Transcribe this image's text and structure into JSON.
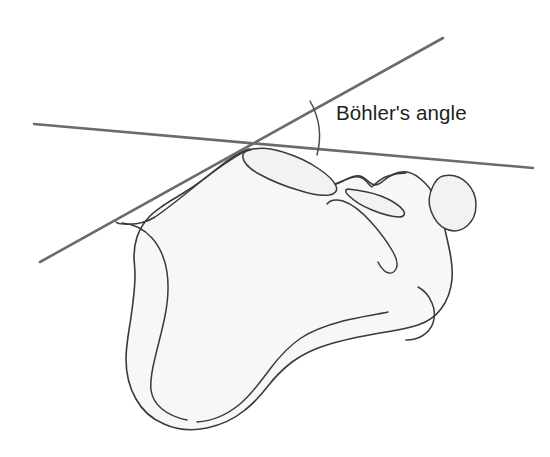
{
  "figure": {
    "title": "Böhler's angle",
    "background_color": "#ffffff",
    "bone_fill_color": "#f7f7f7",
    "bone_stroke_color": "#3a3a3a",
    "line_color": "#6b6b6b",
    "label_color": "#231f20"
  },
  "annotation": {
    "label": "Böhler's angle",
    "label_x": 336,
    "label_y": 103,
    "font_size_px": 20.5
  },
  "geometry": {
    "vertex": {
      "x": 248,
      "y": 148
    },
    "superior_line": {
      "name": "posterior-facet-tangent-line",
      "x1": 34,
      "y1": 124,
      "x2": 533,
      "y2": 168
    },
    "ascending_line": {
      "name": "tuberosity-tangent-line",
      "x1": 40,
      "y1": 262,
      "x2": 443,
      "y2": 38
    },
    "arc": {
      "radius": 72,
      "start_x": 310,
      "start_y": 101,
      "end_x": 317,
      "end_y": 155
    }
  }
}
